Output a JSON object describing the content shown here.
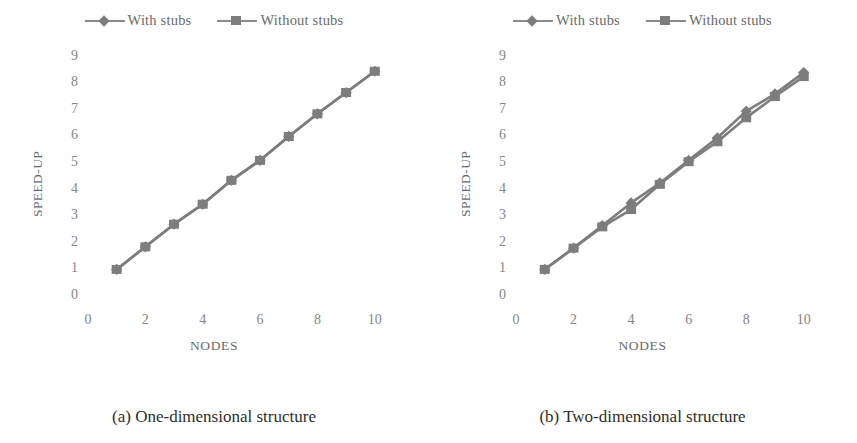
{
  "figure": {
    "panels": [
      {
        "caption": "(a) One-dimensional structure",
        "legend": [
          {
            "label": "With stubs",
            "marker": "diamond-marker-icon",
            "color": "#7d7d7d"
          },
          {
            "label": "Without stubs",
            "marker": "square-marker-icon",
            "color": "#7d7d7d"
          }
        ],
        "chart_data": {
          "type": "line",
          "title": "",
          "xlabel": "NODES",
          "ylabel": "SPEED-UP",
          "x": [
            1,
            2,
            3,
            4,
            5,
            6,
            7,
            8,
            9,
            10
          ],
          "xlim": [
            0,
            10.6
          ],
          "ylim": [
            0,
            9.4
          ],
          "xticks": [
            0,
            2,
            4,
            6,
            8,
            10
          ],
          "yticks": [
            0,
            1,
            2,
            3,
            4,
            5,
            6,
            7,
            8,
            9
          ],
          "grid": false,
          "legend_position": "top-center",
          "series": [
            {
              "name": "With stubs",
              "marker": "diamond",
              "color": "#7d7d7d",
              "values": [
                1.0,
                1.85,
                2.7,
                3.45,
                4.35,
                5.1,
                6.0,
                6.85,
                7.65,
                8.45
              ]
            },
            {
              "name": "Without stubs",
              "marker": "square",
              "color": "#7d7d7d",
              "values": [
                1.0,
                1.85,
                2.7,
                3.45,
                4.35,
                5.1,
                6.0,
                6.85,
                7.65,
                8.45
              ]
            }
          ]
        }
      },
      {
        "caption": "(b) Two-dimensional structure",
        "legend": [
          {
            "label": "With stubs",
            "marker": "diamond-marker-icon",
            "color": "#7d7d7d"
          },
          {
            "label": "Without stubs",
            "marker": "square-marker-icon",
            "color": "#7d7d7d"
          }
        ],
        "chart_data": {
          "type": "line",
          "title": "",
          "xlabel": "NODES",
          "ylabel": "SPEED-UP",
          "x": [
            1,
            2,
            3,
            4,
            5,
            6,
            7,
            8,
            9,
            10
          ],
          "xlim": [
            0,
            10.6
          ],
          "ylim": [
            0,
            9.4
          ],
          "xticks": [
            0,
            2,
            4,
            6,
            8,
            10
          ],
          "yticks": [
            0,
            1,
            2,
            3,
            4,
            5,
            6,
            7,
            8,
            9
          ],
          "grid": false,
          "legend_position": "top-center",
          "series": [
            {
              "name": "With stubs",
              "marker": "diamond",
              "color": "#7d7d7d",
              "values": [
                1.0,
                1.8,
                2.65,
                3.5,
                4.25,
                5.1,
                5.95,
                6.95,
                7.6,
                8.4
              ]
            },
            {
              "name": "Without stubs",
              "marker": "square",
              "color": "#7d7d7d",
              "values": [
                1.0,
                1.8,
                2.6,
                3.25,
                4.2,
                5.05,
                5.8,
                6.7,
                7.5,
                8.25
              ]
            }
          ]
        }
      }
    ]
  }
}
